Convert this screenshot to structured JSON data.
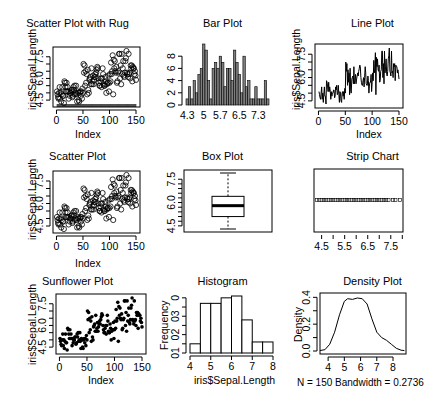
{
  "chart_data": [
    {
      "type": "scatter",
      "title": "Scatter Plot with Rug",
      "xlabel": "Index",
      "ylabel": "iris$Sepal.Length",
      "xticks": [
        "0",
        "50",
        "100",
        "150"
      ],
      "yticks": [
        "4.5",
        "6.0",
        "7.5"
      ],
      "xlim": [
        1,
        150
      ],
      "ylim": [
        4.3,
        7.9
      ],
      "marker": "open-circle",
      "rug": true
    },
    {
      "type": "bar",
      "title": "Bar Plot",
      "xticks": [
        "4.3",
        "5",
        "5.7",
        "6.5",
        "7.3"
      ],
      "yticks": [
        "0",
        "2",
        "4",
        "6",
        "8"
      ],
      "categories": [
        "4.3",
        "4.4",
        "4.5",
        "4.6",
        "4.7",
        "4.8",
        "4.9",
        "5",
        "5.1",
        "5.2",
        "5.3",
        "5.4",
        "5.5",
        "5.6",
        "5.7",
        "5.8",
        "5.9",
        "6",
        "6.1",
        "6.2",
        "6.3",
        "6.4",
        "6.5",
        "6.6",
        "6.7",
        "6.8",
        "6.9",
        "7",
        "7.1",
        "7.2",
        "7.3",
        "7.4",
        "7.6",
        "7.7",
        "7.9"
      ],
      "values": [
        1,
        3,
        1,
        4,
        2,
        5,
        6,
        10,
        9,
        4,
        1,
        6,
        7,
        6,
        8,
        7,
        3,
        6,
        6,
        4,
        9,
        7,
        5,
        2,
        8,
        3,
        4,
        1,
        1,
        3,
        1,
        1,
        1,
        4,
        1
      ],
      "ylim": [
        0,
        10
      ]
    },
    {
      "type": "line",
      "title": "Line Plot",
      "xlabel": "Index",
      "xticks": [
        "0",
        "50",
        "100",
        "150"
      ],
      "yticks": [
        "4.5",
        "6.0",
        "7.5"
      ],
      "xlim": [
        1,
        150
      ],
      "ylim": [
        4.3,
        7.9
      ]
    },
    {
      "type": "scatter",
      "title": "Scatter Plot",
      "xlabel": "Index",
      "ylabel": "iris$Sepal.Length",
      "xticks": [
        "0",
        "50",
        "100",
        "150"
      ],
      "yticks": [
        "4.5",
        "6.0",
        "7.5"
      ],
      "marker": "open-circle"
    },
    {
      "type": "box",
      "title": "Box Plot",
      "yticks": [
        "4.5",
        "6.0",
        "7.5"
      ],
      "min": 4.3,
      "q1": 5.1,
      "median": 5.8,
      "q3": 6.4,
      "max": 7.9
    },
    {
      "type": "strip",
      "title": "Strip Chart",
      "xticks": [
        "4.5",
        "5.5",
        "6.5",
        "7.5"
      ],
      "xlim": [
        4.3,
        7.9
      ],
      "marker": "open-square"
    },
    {
      "type": "scatter",
      "title": "Sunflower Plot",
      "xlabel": "Index",
      "ylabel": "iris$Sepal.Length",
      "xticks": [
        "0",
        "50",
        "100",
        "150"
      ],
      "yticks": [
        "4.5",
        "6.0",
        "7.5"
      ],
      "marker": "filled-dot"
    },
    {
      "type": "bar",
      "title": "Histogram",
      "xlabel": "iris$Sepal.Length",
      "ylabel": "Frequency",
      "xticks": [
        "4",
        "5",
        "6",
        "7",
        "8"
      ],
      "yticks": [
        "0",
        "10",
        "20",
        "30"
      ],
      "bins": [
        [
          4.0,
          4.5
        ],
        [
          4.5,
          5.0
        ],
        [
          5.0,
          5.5
        ],
        [
          5.5,
          6.0
        ],
        [
          6.0,
          6.5
        ],
        [
          6.5,
          7.0
        ],
        [
          7.0,
          7.5
        ],
        [
          7.5,
          8.0
        ]
      ],
      "values": [
        5,
        27,
        27,
        30,
        31,
        18,
        6,
        6
      ],
      "ylim": [
        0,
        31
      ]
    },
    {
      "type": "line",
      "title": "Density Plot",
      "ylabel": "Density",
      "xticks": [
        "4",
        "5",
        "6",
        "7",
        "8"
      ],
      "yticks": [
        "0.0",
        "0.2",
        "0.4"
      ],
      "x": [
        3.5,
        3.8,
        4.1,
        4.4,
        4.7,
        5.0,
        5.2,
        5.5,
        5.8,
        6.1,
        6.4,
        6.7,
        7.0,
        7.3,
        7.6,
        7.9,
        8.2,
        8.5,
        8.7
      ],
      "y": [
        0.004,
        0.01,
        0.05,
        0.14,
        0.27,
        0.37,
        0.39,
        0.385,
        0.395,
        0.39,
        0.35,
        0.24,
        0.14,
        0.1,
        0.08,
        0.05,
        0.02,
        0.006,
        0.003
      ],
      "annotation": "N = 150   Bandwidth = 0.2736"
    }
  ],
  "panels": {
    "p1": {
      "title": "Scatter Plot with Rug",
      "xlabel": "Index",
      "ylabel": "iris$Sepal.Length"
    },
    "p2": {
      "title": "Bar Plot"
    },
    "p3": {
      "title": "Line Plot",
      "xlabel": "Index",
      "left_ylabel": "iris$Sepal.Length"
    },
    "p4": {
      "title": "Scatter Plot",
      "xlabel": "Index",
      "ylabel": "iris$Sepal.Length"
    },
    "p5": {
      "title": "Box Plot"
    },
    "p6": {
      "title": "Strip Chart"
    },
    "p7": {
      "title": "Sunflower Plot",
      "xlabel": "Index",
      "ylabel": "iris$Sepal.Length"
    },
    "p8": {
      "title": "Histogram",
      "xlabel": "iris$Sepal.Length",
      "ylabel": "Frequency"
    },
    "p9": {
      "title": "Density Plot",
      "ylabel": "Density",
      "note": "N = 150   Bandwidth = 0.2736"
    }
  },
  "axes": {
    "index_ticks": [
      "0",
      "50",
      "100",
      "150"
    ],
    "sepal_ticks": [
      "4.5",
      "6.0",
      "7.5"
    ],
    "bar_xticks": [
      "4.3",
      "5",
      "5.7",
      "6.5",
      "7.3"
    ],
    "bar_yticks": [
      "0",
      "2",
      "4",
      "6",
      "8"
    ],
    "strip_ticks": [
      "4.5",
      "5.5",
      "6.5",
      "7.5"
    ],
    "hist_xticks": [
      "4",
      "5",
      "6",
      "7",
      "8"
    ],
    "hist_yticks": [
      "0",
      "10",
      "20",
      "30"
    ],
    "dens_xticks": [
      "4",
      "5",
      "6",
      "7",
      "8"
    ],
    "dens_yticks": [
      "0.0",
      "0.2",
      "0.4"
    ]
  }
}
